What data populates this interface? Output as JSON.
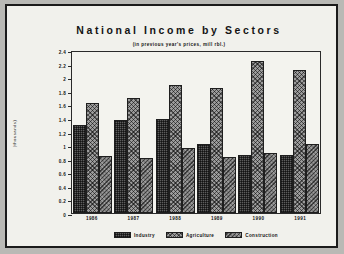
{
  "chart_data": {
    "type": "bar",
    "title": "National Income by Sectors",
    "subtitle": "(in previous year's prices, mill rbl.)",
    "xlabel": "",
    "ylabel": "(thousands)",
    "ylim": [
      0,
      2.4
    ],
    "ytick_step": 0.2,
    "grid": false,
    "legend_position": "bottom",
    "categories": [
      "1986",
      "1987",
      "1988",
      "1989",
      "1990",
      "1991"
    ],
    "yticks": [
      "0",
      "0.2",
      "0.4",
      "0.6",
      "0.8",
      "1",
      "1.2",
      "1.4",
      "1.6",
      "1.8",
      "2",
      "2.2",
      "2.4"
    ],
    "series": [
      {
        "name": "Industry",
        "color": "#5d5d5d",
        "pattern": "cross-hatch-dark",
        "values": [
          1.3,
          1.37,
          1.39,
          1.02,
          0.85,
          0.86
        ]
      },
      {
        "name": "Agriculture",
        "color": "#9b9b9b",
        "pattern": "diagonal-cross",
        "values": [
          1.62,
          1.7,
          1.88,
          1.84,
          2.24,
          2.11
        ]
      },
      {
        "name": "Construction",
        "color": "#7a7a7a",
        "pattern": "diagonal-hatch",
        "values": [
          0.84,
          0.81,
          0.95,
          0.83,
          0.89,
          1.02
        ]
      }
    ]
  }
}
